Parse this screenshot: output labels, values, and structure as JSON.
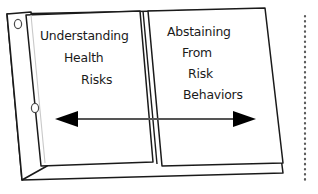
{
  "diagram": {
    "title_alt": "Open binder with two facing pages linked by a double-headed arrow",
    "style": "hand-drawn line art, black ink on white",
    "colors": {
      "ink": "#1a1a1a",
      "paper": "#ffffff",
      "arrow": "#555555",
      "arrowhead": "#000000",
      "ruleline": "#c9c9c9",
      "dotted_border": "#5a5a5a"
    },
    "left_page": {
      "name": "Understanding Health Risks",
      "lines": [
        "Understanding",
        "Health",
        "Risks"
      ]
    },
    "right_page": {
      "name": "Abstaining From Risk Behaviors",
      "lines": [
        "Abstaining",
        "From",
        "Risk",
        "Behaviors"
      ]
    },
    "connector": {
      "kind": "double-headed-arrow",
      "direction": "bidirectional",
      "label": ""
    },
    "binder": {
      "hole_count": 2,
      "holes": [
        {
          "cx": 18,
          "cy": 24
        },
        {
          "cx": 35,
          "cy": 108
        }
      ]
    },
    "right_margin": {
      "kind": "dotted-vertical-line"
    }
  }
}
